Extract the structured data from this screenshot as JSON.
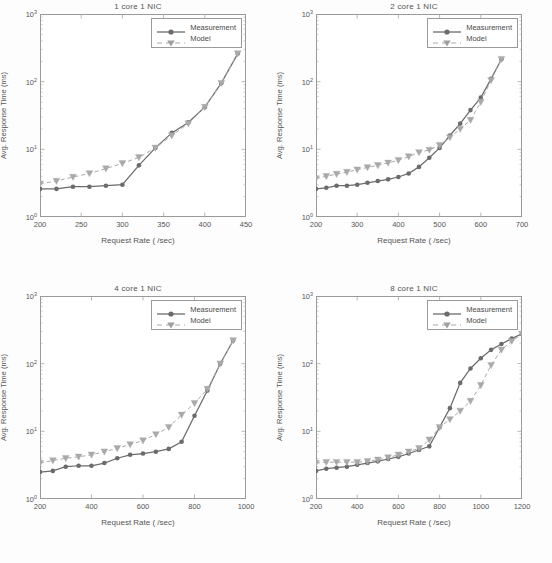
{
  "figure": {
    "y_axis_label": "Avg. Response Time (ms)",
    "x_axis_label": "Request Rate ( /sec)",
    "y_ticks": [
      "10",
      "10",
      "10",
      "10"
    ],
    "y_tick_exponents": [
      "0",
      "1",
      "2",
      "3"
    ],
    "legend": {
      "measurement": "Measurement",
      "model": "Model"
    },
    "colors": {
      "measurement": "#6b6b6b",
      "model": "#a9a9a9",
      "axis": "#9a9a9a",
      "text": "#555555",
      "background": "#ffffff"
    }
  },
  "panels": [
    {
      "title": "1 core 1 NIC"
    },
    {
      "title": "2 core 1 NIC"
    },
    {
      "title": "4 core 1 NIC"
    },
    {
      "title": "8 core 1 NIC"
    }
  ],
  "chart_data": [
    {
      "type": "line",
      "title": "1 core 1 NIC",
      "xlabel": "Request Rate ( /sec)",
      "ylabel": "Avg. Response Time (ms)",
      "xlim": [
        200,
        450
      ],
      "ylim": [
        1,
        1000
      ],
      "yscale": "log",
      "xticks": [
        200,
        250,
        300,
        350,
        400,
        450
      ],
      "yticks": [
        1,
        10,
        100,
        1000
      ],
      "grid": false,
      "legend_position": "top-right",
      "series": [
        {
          "name": "Measurement",
          "marker": "circle",
          "linestyle": "solid",
          "x": [
            200,
            220,
            240,
            260,
            280,
            300,
            320,
            340,
            360,
            380,
            400,
            420,
            440
          ],
          "y": [
            2.6,
            2.6,
            2.8,
            2.8,
            2.9,
            3.0,
            5.8,
            10.5,
            17.5,
            25.0,
            42.0,
            95.0,
            260.0
          ]
        },
        {
          "name": "Model",
          "marker": "triangle-down",
          "linestyle": "dashed",
          "x": [
            200,
            220,
            240,
            260,
            280,
            300,
            320,
            340,
            360,
            380,
            400,
            420,
            440
          ],
          "y": [
            3.1,
            3.4,
            3.9,
            4.4,
            5.2,
            6.2,
            7.6,
            10.5,
            16.0,
            24.0,
            42.0,
            95.0,
            260.0
          ]
        }
      ]
    },
    {
      "type": "line",
      "title": "2 core 1 NIC",
      "xlabel": "Request Rate ( /sec)",
      "ylabel": "Avg. Response Time (ms)",
      "xlim": [
        200,
        700
      ],
      "ylim": [
        1,
        1000
      ],
      "yscale": "log",
      "xticks": [
        200,
        300,
        400,
        500,
        600,
        700
      ],
      "yticks": [
        1,
        10,
        100,
        1000
      ],
      "grid": false,
      "legend_position": "top-right",
      "series": [
        {
          "name": "Measurement",
          "marker": "circle",
          "linestyle": "solid",
          "x": [
            200,
            225,
            250,
            275,
            300,
            325,
            350,
            375,
            400,
            425,
            450,
            475,
            500,
            525,
            550,
            575,
            600,
            625,
            650
          ],
          "y": [
            2.6,
            2.7,
            2.9,
            2.9,
            3.0,
            3.2,
            3.4,
            3.6,
            3.9,
            4.4,
            5.5,
            7.5,
            10.5,
            16.0,
            24.0,
            38.0,
            58.0,
            110.0,
            215.0
          ]
        },
        {
          "name": "Model",
          "marker": "triangle-down",
          "linestyle": "dashed",
          "x": [
            200,
            225,
            250,
            275,
            300,
            325,
            350,
            375,
            400,
            425,
            450,
            475,
            500,
            525,
            550,
            575,
            600,
            625,
            650
          ],
          "y": [
            3.7,
            4.0,
            4.3,
            4.6,
            5.0,
            5.4,
            5.8,
            6.3,
            6.9,
            7.8,
            9.0,
            9.8,
            11.5,
            15.0,
            20.0,
            27.0,
            50.0,
            105.0,
            215.0
          ]
        }
      ]
    },
    {
      "type": "line",
      "title": "4 core 1 NIC",
      "xlabel": "Request Rate ( /sec)",
      "ylabel": "Avg. Response Time (ms)",
      "xlim": [
        200,
        1000
      ],
      "ylim": [
        1,
        1000
      ],
      "yscale": "log",
      "xticks": [
        200,
        400,
        600,
        800,
        1000
      ],
      "yticks": [
        1,
        10,
        100,
        1000
      ],
      "grid": false,
      "legend_position": "top-right",
      "series": [
        {
          "name": "Measurement",
          "marker": "circle",
          "linestyle": "solid",
          "x": [
            200,
            250,
            300,
            350,
            400,
            450,
            500,
            550,
            600,
            650,
            700,
            750,
            800,
            850,
            900,
            950
          ],
          "y": [
            2.5,
            2.6,
            3.0,
            3.1,
            3.1,
            3.4,
            4.0,
            4.5,
            4.7,
            5.0,
            5.5,
            7.0,
            17.0,
            40.0,
            100.0,
            220.0
          ]
        },
        {
          "name": "Model",
          "marker": "triangle-down",
          "linestyle": "dashed",
          "x": [
            200,
            250,
            300,
            350,
            400,
            450,
            500,
            550,
            600,
            650,
            700,
            750,
            800,
            850,
            900,
            950
          ],
          "y": [
            3.4,
            3.7,
            4.0,
            4.2,
            4.5,
            5.0,
            5.6,
            6.4,
            7.3,
            9.0,
            11.5,
            17.5,
            26.0,
            42.0,
            100.0,
            220.0
          ]
        }
      ]
    },
    {
      "type": "line",
      "title": "8 core 1 NIC",
      "xlabel": "Request Rate ( /sec)",
      "ylabel": "Avg. Response Time (ms)",
      "xlim": [
        200,
        1200
      ],
      "ylim": [
        1,
        1000
      ],
      "yscale": "log",
      "xticks": [
        200,
        400,
        600,
        800,
        1000,
        1200
      ],
      "yticks": [
        1,
        10,
        100,
        1000
      ],
      "grid": false,
      "legend_position": "top-right",
      "series": [
        {
          "name": "Measurement",
          "marker": "circle",
          "linestyle": "solid",
          "x": [
            200,
            250,
            300,
            350,
            400,
            450,
            500,
            550,
            600,
            650,
            700,
            750,
            800,
            850,
            900,
            950,
            1000,
            1050,
            1100,
            1150,
            1200
          ],
          "y": [
            2.6,
            2.8,
            2.9,
            3.0,
            3.2,
            3.4,
            3.6,
            3.9,
            4.2,
            4.7,
            5.3,
            6.0,
            11.5,
            22.0,
            52.0,
            85.0,
            120.0,
            160.0,
            195.0,
            235.0,
            275.0
          ]
        },
        {
          "name": "Model",
          "marker": "triangle-down",
          "linestyle": "dashed",
          "x": [
            200,
            250,
            300,
            350,
            400,
            450,
            500,
            550,
            600,
            650,
            700,
            750,
            800,
            850,
            900,
            950,
            1000,
            1050,
            1100,
            1150,
            1200
          ],
          "y": [
            3.4,
            3.5,
            3.5,
            3.5,
            3.5,
            3.6,
            3.8,
            4.1,
            4.5,
            5.0,
            5.6,
            7.5,
            11.5,
            15.0,
            20.0,
            28.0,
            48.0,
            95.0,
            160.0,
            215.0,
            275.0
          ]
        }
      ]
    }
  ]
}
